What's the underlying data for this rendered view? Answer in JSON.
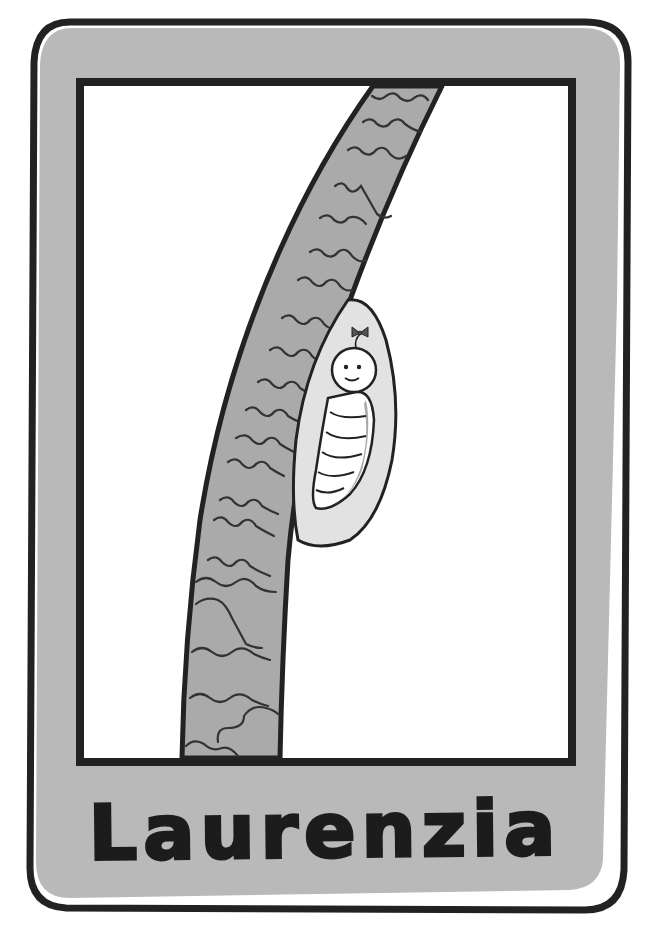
{
  "card": {
    "name": "Laurenzia",
    "colors": {
      "frame_fill": "#b8b8b8",
      "outline": "#222222",
      "picture_bg": "#ffffff",
      "branch_fill": "#a9a9a9",
      "cocoon_fill": "#e2e2e2",
      "larva_fill": "#ffffff",
      "larva_shadow": "#a8a8a8"
    }
  },
  "illustration": {
    "subject": "smiling larva inside cocoon attached to a branch",
    "elements": [
      "branch",
      "cocoon",
      "larva",
      "bow"
    ]
  }
}
